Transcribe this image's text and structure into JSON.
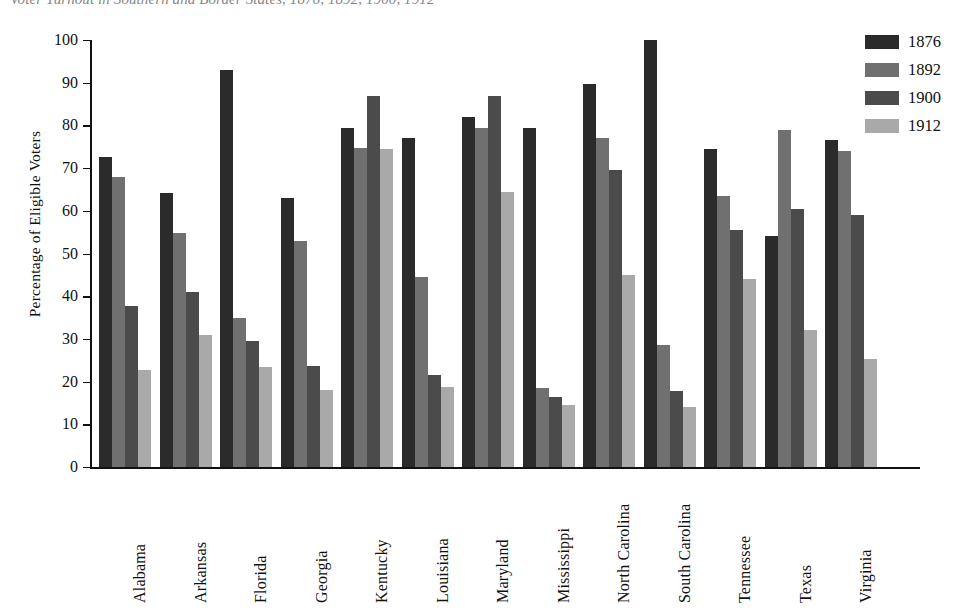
{
  "chart_data": {
    "type": "bar",
    "title": "Voter Turnout in Southern and Border States, 1876, 1892, 1900, 1912",
    "xlabel": "",
    "ylabel": "Percentage of Eligible Voters",
    "ylim": [
      0,
      100
    ],
    "yticks": [
      0,
      10,
      20,
      30,
      40,
      50,
      60,
      70,
      80,
      90,
      100
    ],
    "grid": false,
    "legend_position": "top-right",
    "categories": [
      "Alabama",
      "Arkansas",
      "Florida",
      "Georgia",
      "Kentucky",
      "Louisiana",
      "Maryland",
      "Mississippi",
      "North Carolina",
      "South Carolina",
      "Tennessee",
      "Texas",
      "Virginia"
    ],
    "series": [
      {
        "name": "1876",
        "color": "#2b2b2b",
        "values": [
          72.5,
          64.2,
          93.0,
          63.0,
          79.5,
          77.0,
          82.0,
          79.5,
          89.8,
          100.0,
          74.5,
          54.0,
          76.7
        ]
      },
      {
        "name": "1892",
        "color": "#707070",
        "values": [
          68.0,
          54.8,
          34.8,
          53.0,
          74.8,
          44.5,
          79.5,
          18.5,
          77.0,
          28.5,
          63.5,
          79.0,
          74.0
        ]
      },
      {
        "name": "1900",
        "color": "#4b4b4b",
        "values": [
          37.8,
          41.0,
          29.5,
          23.7,
          87.0,
          21.5,
          87.0,
          16.5,
          69.5,
          17.8,
          55.5,
          60.5,
          59.0
        ]
      },
      {
        "name": "1912",
        "color": "#a9a9a9",
        "values": [
          22.8,
          31.0,
          23.5,
          18.0,
          74.5,
          18.8,
          64.5,
          14.5,
          45.0,
          14.0,
          44.0,
          32.0,
          25.2
        ]
      }
    ]
  },
  "legend": {
    "items": [
      {
        "label": "1876"
      },
      {
        "label": "1892"
      },
      {
        "label": "1900"
      },
      {
        "label": "1912"
      }
    ]
  }
}
